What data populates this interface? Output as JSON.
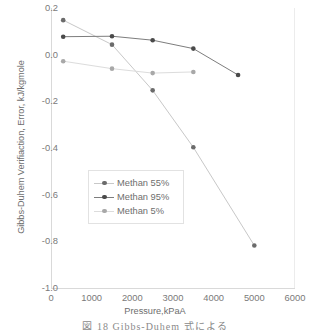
{
  "chart_data": {
    "type": "line",
    "title": "",
    "xlabel": "Pressure,kPaA",
    "ylabel": "Gibbs-Duhem Verifiaction, Error, kJ/kgmole",
    "xlim": [
      0,
      6000
    ],
    "ylim": [
      -1.0,
      0.2
    ],
    "xticks": [
      "0",
      "1000",
      "2000",
      "3000",
      "4000",
      "5000",
      "6000"
    ],
    "yticks": [
      "0.2",
      "0.0",
      "-0.2",
      "-0.4",
      "-0.6",
      "-0.8",
      "-1.0"
    ],
    "grid": false,
    "legend_position": "center-left",
    "series": [
      {
        "name": "Methan 55%",
        "color": "#c8c8c8",
        "marker_color": "#6b6b6b",
        "x": [
          300,
          1500,
          2500,
          3500,
          5000
        ],
        "y": [
          0.148,
          0.043,
          -0.153,
          -0.397,
          -0.818
        ]
      },
      {
        "name": "Methan 95%",
        "color": "#7d7d7d",
        "marker_color": "#4a4a4a",
        "x": [
          300,
          1500,
          2500,
          3500,
          4600
        ],
        "y": [
          0.077,
          0.079,
          0.062,
          0.026,
          -0.087
        ]
      },
      {
        "name": "Methan 5%",
        "color": "#dcdcdc",
        "marker_color": "#a8a8a8",
        "x": [
          300,
          1500,
          2500,
          3500
        ],
        "y": [
          -0.028,
          -0.06,
          -0.079,
          -0.074
        ]
      }
    ]
  },
  "caption": {
    "text": "図 18  Gibbs-Duhem 式による"
  }
}
